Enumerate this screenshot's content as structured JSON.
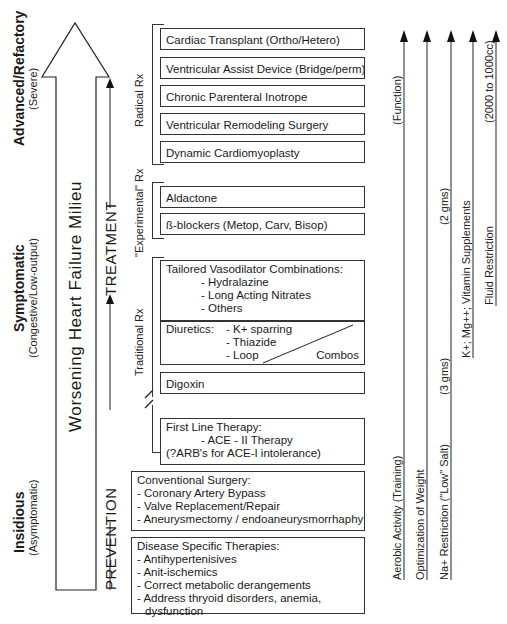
{
  "stages": [
    {
      "title": "Advanced/Refactory",
      "subtitle": "(Severe)"
    },
    {
      "title": "Symptomatic",
      "subtitle": "(Congestive/Low-output)"
    },
    {
      "title": "Insidious",
      "subtitle": "(Asymptomatic)"
    }
  ],
  "big_arrow": {
    "label": "Worsening Heart Failure Milieu"
  },
  "flow": {
    "from": "PREVENTION",
    "to": "TREATMENT"
  },
  "rx_groups": [
    {
      "label": "Radical Rx"
    },
    {
      "label": "\"Experimental\" Rx"
    },
    {
      "label": "Traditional Rx"
    }
  ],
  "radical_items": [
    "Cardiac Transplant (Ortho/Hetero)",
    "Ventricular Assist Device (Bridge/perm)",
    "Chronic Parenteral Inotrope",
    "Ventricular Remodeling Surgery",
    "Dynamic Cardiomyoplasty"
  ],
  "experimental_items": [
    "Aldactone",
    "ß-blockers (Metop, Carv, Bisop)"
  ],
  "traditional": {
    "vasodilators": {
      "title": "Tailored Vasodilator Combinations:",
      "items": [
        "- Hydralazine",
        "- Long Acting Nitrates",
        "- Others"
      ]
    },
    "diuretics": {
      "title": "Diuretics:",
      "items": [
        "- K+ sparring",
        "- Thiazide",
        "- Loop"
      ],
      "combo_label": "Combos"
    },
    "digoxin": "Digoxin",
    "first_line": {
      "title": "First Line Therapy:",
      "line1": "- ACE - II Therapy",
      "line2": "(?ARB's for ACE-I intolerance)"
    }
  },
  "prevention": {
    "surgery": {
      "title": "Conventional Surgery:",
      "items": [
        "- Coronary Artery Bypass",
        "- Valve Replacement/Repair",
        "- Aneurysmectomy / endoaneurysmorrhaphy"
      ]
    },
    "disease_specific": {
      "title": "Disease Specific Therapies:",
      "items": [
        "- Antihypertenisives",
        "- Anit-ischemics",
        "- Correct metabolic derangements",
        "- Address thryoid disorders, anemia,",
        "dysfunction"
      ]
    }
  },
  "lifestyle": [
    {
      "label": "Aerobic Activity (Training)",
      "note": "(Function)"
    },
    {
      "label": "Optimization of Weight",
      "note": ""
    },
    {
      "label": "Na+ Restriction (\"Low\" Salt)",
      "note_low": "(3 gms)",
      "note_high": "(2 gms)"
    },
    {
      "label": "K+; Mg++; Vitamin Supplements",
      "note": ""
    },
    {
      "label": "Fluid Restriction",
      "note": "(2000 to 1000cc)"
    }
  ]
}
